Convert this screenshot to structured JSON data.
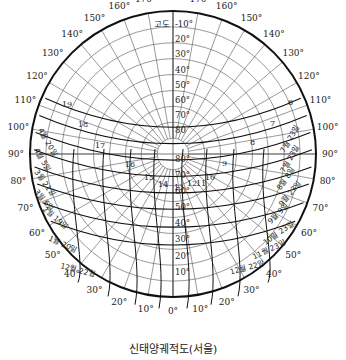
{
  "caption": "신태양궤적도(서울)",
  "altitude_header": "고도",
  "center": {
    "x": 173,
    "y": 154,
    "r": 143
  },
  "azimuth_labels": [
    {
      "deg": 180,
      "text": "180°"
    },
    {
      "deg": 170,
      "text": "170°"
    },
    {
      "deg": 160,
      "text": "160°"
    },
    {
      "deg": 150,
      "text": "150°"
    },
    {
      "deg": 140,
      "text": "140°"
    },
    {
      "deg": 130,
      "text": "130°"
    },
    {
      "deg": 120,
      "text": "120°"
    },
    {
      "deg": 110,
      "text": "110°"
    },
    {
      "deg": 100,
      "text": "100°"
    },
    {
      "deg": 90,
      "text": "90°"
    },
    {
      "deg": 80,
      "text": "80°"
    },
    {
      "deg": 70,
      "text": "70°"
    },
    {
      "deg": 60,
      "text": "60°"
    },
    {
      "deg": 50,
      "text": "50°"
    },
    {
      "deg": 40,
      "text": "40°"
    },
    {
      "deg": 30,
      "text": "30°"
    },
    {
      "deg": 20,
      "text": "20°"
    },
    {
      "deg": 10,
      "text": "10°"
    },
    {
      "deg": 0,
      "text": "0°"
    }
  ],
  "altitude_labels_upper": [
    "-10°",
    "20°",
    "30°",
    "40°",
    "50°",
    "60°",
    "70°",
    "80"
  ],
  "altitude_labels_lower": [
    "80°",
    "70°",
    "60°",
    "50°",
    "40°",
    "30°",
    "20°",
    "10°"
  ],
  "hour_labels": {
    "west": [
      "19",
      "18",
      "17",
      "16",
      "15",
      "14",
      "13"
    ],
    "east": [
      "6",
      "7",
      "8",
      "9",
      "10",
      "11",
      "12"
    ]
  },
  "date_labels": {
    "left": [
      "4월 20일",
      "4월 5일",
      "3월 21일",
      "3월 6일",
      "2월 19일",
      "1월 20일",
      "12월 22일"
    ],
    "right": [
      "7월 23일",
      "7월 23일",
      "8월 8일",
      "9월 23일",
      "9월 9일",
      "10월 23일",
      "11월 23일",
      "12월 22일"
    ]
  },
  "chart_data": {
    "type": "polar-sun-path",
    "title": "신태양궤적도(서울)",
    "location": "서울",
    "azimuth_ticks_deg": [
      0,
      10,
      20,
      30,
      40,
      50,
      60,
      70,
      80,
      90,
      100,
      110,
      120,
      130,
      140,
      150,
      160,
      170,
      180
    ],
    "altitude_rings_deg": [
      -10,
      20,
      30,
      40,
      50,
      60,
      70,
      80
    ],
    "hour_lines": [
      6,
      7,
      8,
      9,
      10,
      11,
      12,
      13,
      14,
      15,
      16,
      17,
      18,
      19
    ],
    "date_curves": [
      "6월 22일",
      "7월 23일",
      "8월 8일",
      "8월 23일",
      "9월 9일",
      "9월 23일",
      "10월 23일",
      "11월 23일",
      "12월 22일",
      "1월 20일",
      "2월 19일",
      "3월 6일",
      "3월 21일",
      "4월 5일",
      "4월 20일"
    ]
  }
}
